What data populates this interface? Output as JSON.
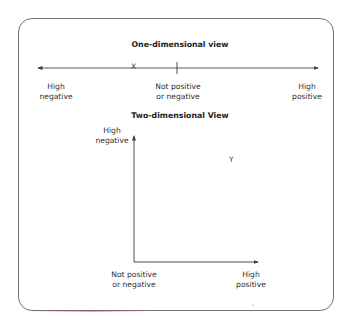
{
  "one_dimensional": {
    "title": "One-dimensional view",
    "left_label_line1": "High",
    "left_label_line2": "negative",
    "center_label_line1": "Not positive",
    "center_label_line2": "or negative",
    "right_label_line1": "High",
    "right_label_line2": "positive",
    "point_label": "X"
  },
  "two_dimensional": {
    "title": "Two-dimensional View",
    "y_axis_label_line1": "High",
    "y_axis_label_line2": "negative",
    "origin_label_line1": "Not positive",
    "origin_label_line2": "or negative",
    "x_axis_label_line1": "High",
    "x_axis_label_line2": "positive",
    "point_label": "Y"
  },
  "colors": {
    "frame": "#7a6e72",
    "line": "#3a3a3a",
    "text": "#2e2e2e"
  }
}
